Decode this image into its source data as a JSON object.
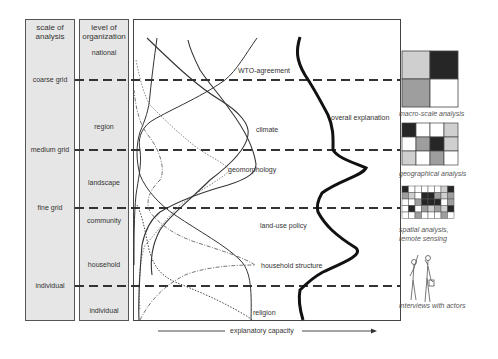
{
  "columns": {
    "scale": {
      "header": "scale of analysis",
      "header_l1": "scale of",
      "header_l2": "analysis",
      "levels": [
        "coarse grid",
        "medium grid",
        "fine grid",
        "individual"
      ]
    },
    "organization": {
      "header_l1": "level of",
      "header_l2": "organization",
      "levels": [
        "national",
        "region",
        "landscape",
        "community",
        "household",
        "individual"
      ]
    }
  },
  "curves": {
    "labels": {
      "wto": "WTO-agreement",
      "climate": "climate",
      "geomorphology": "geomorphology",
      "land_use_policy": "land-use policy",
      "household_structure": "household structure",
      "religion": "religion",
      "overall": "overall explanation"
    }
  },
  "x_axis": {
    "label": "explanatory capacity"
  },
  "methods": [
    {
      "caption": "macro-scale analysis",
      "icon": "2x2-grid-icon"
    },
    {
      "caption": "geographical analysis",
      "icon": "4x3-grid-icon"
    },
    {
      "caption_l1": "spatial analysis,",
      "caption_l2": "remote sensing",
      "icon": "fine-grid-icon"
    },
    {
      "caption": "interviews with actors",
      "icon": "people-icon"
    }
  ],
  "colors": {
    "panel_bg": "#e6e6e6",
    "line": "#333333",
    "dash": "#333333",
    "overall": "#111111"
  }
}
